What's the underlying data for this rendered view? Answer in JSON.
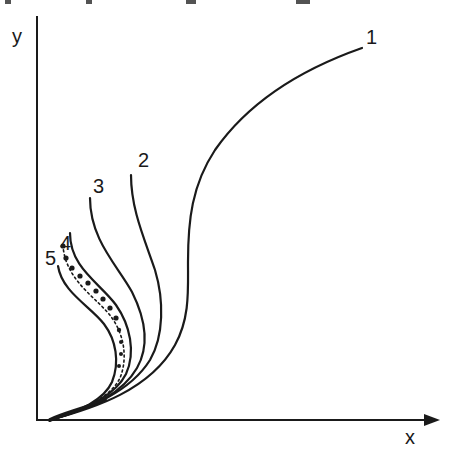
{
  "figure": {
    "axes": {
      "x_label": "x",
      "y_label": "y"
    },
    "curves": [
      {
        "id": "1",
        "label": "1",
        "style": "solid"
      },
      {
        "id": "2",
        "label": "2",
        "style": "solid"
      },
      {
        "id": "3",
        "label": "3",
        "style": "solid"
      },
      {
        "id": "4",
        "label": "4",
        "style": "solid"
      },
      {
        "id": "5",
        "label": "5",
        "style": "dotted-with-dots"
      },
      {
        "id": "5b",
        "label": "",
        "style": "solid"
      }
    ]
  }
}
